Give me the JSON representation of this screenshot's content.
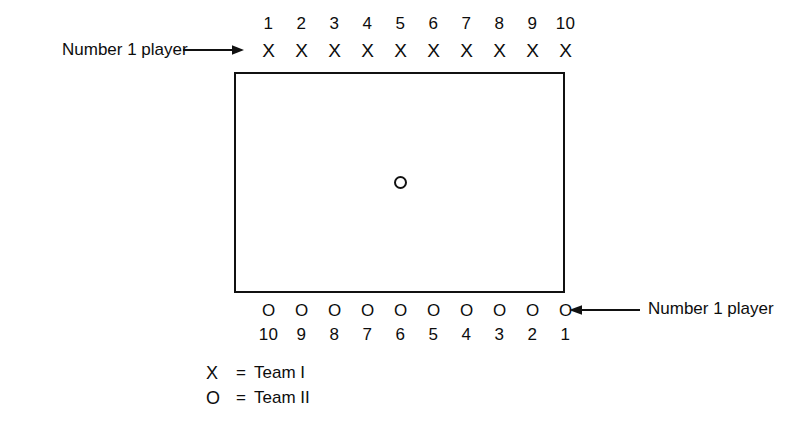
{
  "diagram": {
    "field": {
      "name": "playing-field",
      "center_marker": "O"
    },
    "top_row": {
      "numbers": [
        "1",
        "2",
        "3",
        "4",
        "5",
        "6",
        "7",
        "8",
        "9",
        "10"
      ],
      "markers": [
        "X",
        "X",
        "X",
        "X",
        "X",
        "X",
        "X",
        "X",
        "X",
        "X"
      ],
      "callout": {
        "label": "Number 1 player",
        "arrow": "right-arrow-icon"
      }
    },
    "bottom_row": {
      "markers": [
        "O",
        "O",
        "O",
        "O",
        "O",
        "O",
        "O",
        "O",
        "O",
        "O"
      ],
      "numbers": [
        "10",
        "9",
        "8",
        "7",
        "6",
        "5",
        "4",
        "3",
        "2",
        "1"
      ],
      "callout": {
        "label": "Number 1 player",
        "arrow": "left-arrow-icon"
      }
    },
    "legend": [
      {
        "symbol": "X",
        "equals": "=",
        "label": "Team I"
      },
      {
        "symbol": "O",
        "equals": "=",
        "label": "Team II"
      }
    ],
    "colors": {
      "ink": "#111111",
      "background": "#ffffff"
    }
  }
}
